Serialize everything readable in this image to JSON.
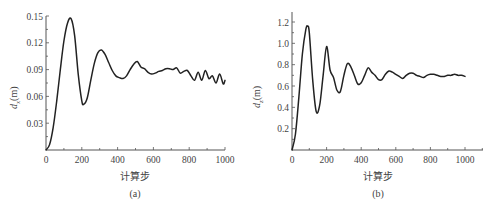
{
  "chart_data": [
    {
      "type": "line",
      "id": "a",
      "caption": "(a)",
      "title": "",
      "xlabel": "计算步",
      "ylabel_symbol": "d",
      "ylabel_sub": "x",
      "ylabel_unit": "(m)",
      "xlim": [
        0,
        1000
      ],
      "ylim": [
        0,
        0.15
      ],
      "xticks": [
        0,
        200,
        400,
        600,
        800,
        1000
      ],
      "xtick_labels": [
        "0",
        "200",
        "400",
        "600",
        "800",
        "1000"
      ],
      "yticks": [
        0.03,
        0.06,
        0.09,
        0.12,
        0.15
      ],
      "ytick_labels": [
        "0.03",
        "0.06",
        "0.09",
        "0.12",
        "0.15"
      ],
      "grid": false,
      "legend": null,
      "series": [
        {
          "name": "d_x",
          "x": [
            0,
            20,
            40,
            60,
            80,
            100,
            120,
            140,
            160,
            180,
            200,
            210,
            230,
            250,
            270,
            290,
            310,
            330,
            350,
            370,
            390,
            410,
            430,
            450,
            470,
            490,
            510,
            530,
            550,
            570,
            590,
            610,
            630,
            650,
            670,
            690,
            710,
            730,
            750,
            770,
            790,
            810,
            830,
            850,
            870,
            890,
            910,
            930,
            950,
            970,
            990,
            1000
          ],
          "y": [
            0.0,
            0.006,
            0.025,
            0.055,
            0.09,
            0.122,
            0.142,
            0.147,
            0.128,
            0.085,
            0.055,
            0.051,
            0.058,
            0.078,
            0.097,
            0.109,
            0.112,
            0.107,
            0.098,
            0.089,
            0.083,
            0.081,
            0.08,
            0.083,
            0.09,
            0.096,
            0.099,
            0.093,
            0.091,
            0.087,
            0.085,
            0.086,
            0.088,
            0.089,
            0.091,
            0.091,
            0.09,
            0.092,
            0.086,
            0.088,
            0.089,
            0.083,
            0.078,
            0.087,
            0.078,
            0.089,
            0.08,
            0.083,
            0.075,
            0.085,
            0.074,
            0.078
          ]
        }
      ]
    },
    {
      "type": "line",
      "id": "b",
      "caption": "(b)",
      "title": "",
      "xlabel": "计算步",
      "ylabel_symbol": "d",
      "ylabel_sub": "z",
      "ylabel_unit": "(m)",
      "xlim": [
        0,
        1100
      ],
      "ylim": [
        0,
        1.3
      ],
      "xticks": [
        0,
        200,
        400,
        600,
        800,
        1000
      ],
      "xtick_labels": [
        "0",
        "200",
        "400",
        "600",
        "800",
        "1000"
      ],
      "yticks": [
        0.2,
        0.4,
        0.6,
        0.8,
        1.0,
        1.2
      ],
      "ytick_labels": [
        "0.2",
        "0.4",
        "0.6",
        "0.8",
        "1.0",
        "1.2"
      ],
      "grid": false,
      "legend": null,
      "series": [
        {
          "name": "d_z",
          "x": [
            0,
            20,
            40,
            60,
            80,
            90,
            100,
            120,
            140,
            160,
            180,
            200,
            220,
            240,
            260,
            280,
            300,
            320,
            340,
            360,
            380,
            400,
            420,
            440,
            460,
            480,
            500,
            520,
            540,
            560,
            580,
            600,
            620,
            640,
            660,
            680,
            700,
            720,
            740,
            760,
            780,
            800,
            820,
            840,
            860,
            880,
            900,
            920,
            940,
            960,
            980,
            1000
          ],
          "y": [
            0.0,
            0.15,
            0.5,
            0.9,
            1.13,
            1.16,
            1.1,
            0.65,
            0.36,
            0.42,
            0.7,
            0.97,
            0.75,
            0.68,
            0.56,
            0.55,
            0.7,
            0.81,
            0.78,
            0.7,
            0.62,
            0.63,
            0.7,
            0.77,
            0.73,
            0.7,
            0.66,
            0.66,
            0.71,
            0.74,
            0.73,
            0.71,
            0.69,
            0.67,
            0.7,
            0.72,
            0.72,
            0.7,
            0.69,
            0.68,
            0.7,
            0.71,
            0.71,
            0.7,
            0.69,
            0.69,
            0.7,
            0.7,
            0.71,
            0.7,
            0.7,
            0.69
          ]
        }
      ]
    }
  ]
}
